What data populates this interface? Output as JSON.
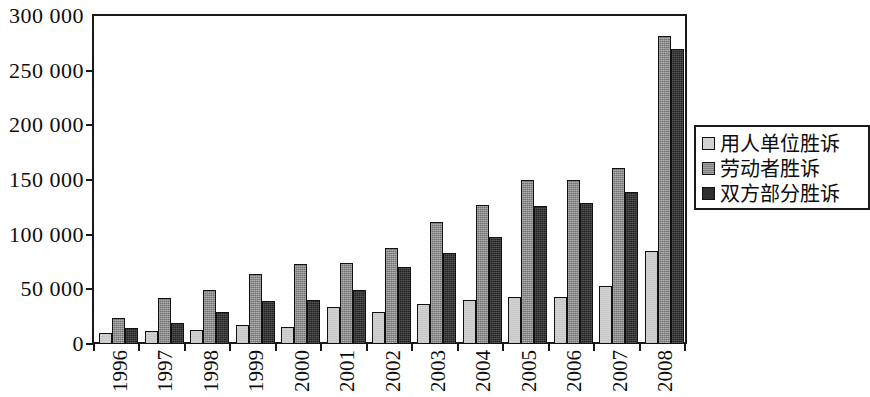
{
  "chart_data": {
    "type": "bar",
    "title": "",
    "subtitle": "",
    "xlabel": "",
    "ylabel": "",
    "grid": false,
    "legend_position": "right",
    "ylim": [
      0,
      300000
    ],
    "ytick_labels": [
      "300 000",
      "250 000",
      "200 000",
      "150 000",
      "100 000",
      "50 000",
      "0"
    ],
    "ytick_values": [
      300000,
      250000,
      200000,
      150000,
      100000,
      50000,
      0
    ],
    "categories": [
      "1996",
      "1997",
      "1998",
      "1999",
      "2000",
      "2001",
      "2002",
      "2003",
      "2004",
      "2005",
      "2006",
      "2007",
      "2008"
    ],
    "series": [
      {
        "name": "用人单位胜诉",
        "color": "#d2d2d2",
        "values": [
          10000,
          12000,
          13000,
          17000,
          16000,
          34000,
          29000,
          37000,
          40000,
          43000,
          43000,
          53000,
          85000
        ]
      },
      {
        "name": "劳动者胜诉",
        "color": "#8c8c8c",
        "values": [
          24000,
          42000,
          49000,
          64000,
          73000,
          74000,
          88000,
          112000,
          127000,
          150000,
          150000,
          161000,
          282000
        ]
      },
      {
        "name": "双方部分胜诉",
        "color": "#2e2e2e",
        "values": [
          15000,
          19000,
          29000,
          39000,
          40000,
          49000,
          70000,
          83000,
          98000,
          126000,
          129000,
          139000,
          270000
        ]
      }
    ]
  },
  "legend": {
    "items": [
      {
        "label": "用人单位胜诉",
        "swatch": "light-gray-swatch"
      },
      {
        "label": "劳动者胜诉",
        "swatch": "medium-gray-swatch"
      },
      {
        "label": "双方部分胜诉",
        "swatch": "dark-gray-swatch"
      }
    ]
  },
  "colors": {
    "series_light": "#d2d2d2",
    "series_medium": "#8c8c8c",
    "series_dark": "#2e2e2e",
    "axis": "#1a1a1a",
    "background": "#ffffff",
    "text": "#0d0d0d"
  }
}
